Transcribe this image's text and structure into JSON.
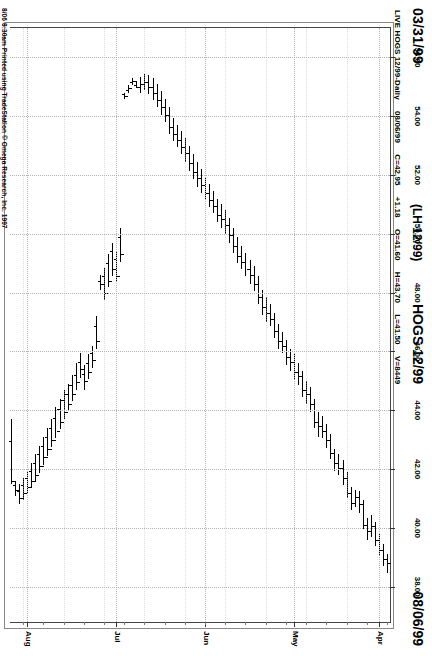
{
  "header": {
    "date_left": "03/31/99",
    "symbol_paren": "(LH 12/99)",
    "symbol_title": "HOGS 12/99",
    "date_right": "08/06/99"
  },
  "quote": {
    "instrument": "LIVE HOGS 12/99-Daily",
    "date": "08/06/99",
    "close": "C=42.95",
    "change": "+1.18",
    "open": "O=41.60",
    "high": "H=43.70",
    "low": "L=41.50",
    "volume": "V=8449"
  },
  "credit": "8/06 8:30am Printed using TradeStation © Omega Research, Inc. 1997",
  "colors": {
    "bar": "#000000",
    "grid": "#b4b4b4",
    "frame": "#444444",
    "background": "#ffffff"
  },
  "chart_data": {
    "type": "ohlc-bar",
    "title": "HOGS 12/99",
    "subtitle": "LIVE HOGS 12/99-Daily",
    "orientation": "rotated-90",
    "xlabel": "",
    "ylabel": "",
    "grid": true,
    "legend": "none",
    "ylim": [
      36.8,
      57.0
    ],
    "price_ticks": [
      "56.00",
      "54.00",
      "52.00",
      "50.00",
      "48.00",
      "46.00",
      "44.00",
      "42.00",
      "40.00",
      "38.00"
    ],
    "price_tick_values": [
      56.0,
      54.0,
      52.0,
      50.0,
      48.0,
      46.0,
      44.0,
      42.0,
      40.0,
      38.0
    ],
    "date_ticks": [
      "Apr",
      "May",
      "Jun",
      "Jul",
      "Aug"
    ],
    "date_tick_index": [
      2,
      23,
      45,
      67,
      89
    ],
    "xlim_dates": [
      "03/31/99",
      "08/06/99"
    ],
    "n_bars": 94,
    "bars": [
      {
        "i": 0,
        "o": 38.8,
        "h": 39.1,
        "l": 38.45,
        "c": 38.95
      },
      {
        "i": 1,
        "o": 38.95,
        "h": 39.45,
        "l": 38.7,
        "c": 39.25
      },
      {
        "i": 2,
        "o": 39.25,
        "h": 39.8,
        "l": 39.05,
        "c": 39.6
      },
      {
        "i": 3,
        "o": 39.6,
        "h": 40.2,
        "l": 39.4,
        "c": 40.05
      },
      {
        "i": 4,
        "o": 40.05,
        "h": 40.45,
        "l": 39.7,
        "c": 39.9
      },
      {
        "i": 5,
        "o": 39.9,
        "h": 40.35,
        "l": 39.6,
        "c": 40.1
      },
      {
        "i": 6,
        "o": 40.1,
        "h": 40.95,
        "l": 39.95,
        "c": 40.8
      },
      {
        "i": 7,
        "o": 40.8,
        "h": 41.25,
        "l": 40.5,
        "c": 41.05
      },
      {
        "i": 8,
        "o": 41.05,
        "h": 41.3,
        "l": 40.7,
        "c": 40.85
      },
      {
        "i": 9,
        "o": 40.85,
        "h": 41.4,
        "l": 40.6,
        "c": 41.2
      },
      {
        "i": 10,
        "o": 41.2,
        "h": 41.9,
        "l": 41.0,
        "c": 41.7
      },
      {
        "i": 11,
        "o": 41.7,
        "h": 42.3,
        "l": 41.45,
        "c": 42.05
      },
      {
        "i": 12,
        "o": 42.05,
        "h": 42.5,
        "l": 41.8,
        "c": 42.2
      },
      {
        "i": 13,
        "o": 42.2,
        "h": 42.7,
        "l": 41.95,
        "c": 42.55
      },
      {
        "i": 14,
        "o": 42.55,
        "h": 43.2,
        "l": 42.35,
        "c": 43.0
      },
      {
        "i": 15,
        "o": 43.0,
        "h": 43.55,
        "l": 42.7,
        "c": 43.3
      },
      {
        "i": 16,
        "o": 43.3,
        "h": 43.8,
        "l": 43.05,
        "c": 43.45
      },
      {
        "i": 17,
        "o": 43.45,
        "h": 43.95,
        "l": 43.1,
        "c": 43.6
      },
      {
        "i": 18,
        "o": 43.6,
        "h": 44.4,
        "l": 43.4,
        "c": 44.2
      },
      {
        "i": 19,
        "o": 44.2,
        "h": 44.8,
        "l": 43.95,
        "c": 44.55
      },
      {
        "i": 20,
        "o": 44.55,
        "h": 45.0,
        "l": 44.2,
        "c": 44.7
      },
      {
        "i": 21,
        "o": 44.7,
        "h": 45.35,
        "l": 44.45,
        "c": 45.15
      },
      {
        "i": 22,
        "o": 45.15,
        "h": 45.6,
        "l": 44.85,
        "c": 45.3
      },
      {
        "i": 23,
        "o": 45.3,
        "h": 45.9,
        "l": 45.05,
        "c": 45.65
      },
      {
        "i": 24,
        "o": 45.65,
        "h": 46.1,
        "l": 45.35,
        "c": 45.8
      },
      {
        "i": 25,
        "o": 45.8,
        "h": 46.4,
        "l": 45.55,
        "c": 46.2
      },
      {
        "i": 26,
        "o": 46.2,
        "h": 46.65,
        "l": 45.95,
        "c": 46.35
      },
      {
        "i": 27,
        "o": 46.35,
        "h": 46.95,
        "l": 46.1,
        "c": 46.7
      },
      {
        "i": 28,
        "o": 46.7,
        "h": 47.3,
        "l": 46.45,
        "c": 47.1
      },
      {
        "i": 29,
        "o": 47.1,
        "h": 47.6,
        "l": 46.85,
        "c": 47.3
      },
      {
        "i": 30,
        "o": 47.3,
        "h": 47.85,
        "l": 47.0,
        "c": 47.5
      },
      {
        "i": 31,
        "o": 47.5,
        "h": 48.1,
        "l": 47.25,
        "c": 47.85
      },
      {
        "i": 32,
        "o": 47.85,
        "h": 48.55,
        "l": 47.6,
        "c": 48.3
      },
      {
        "i": 33,
        "o": 48.3,
        "h": 48.9,
        "l": 48.05,
        "c": 48.6
      },
      {
        "i": 34,
        "o": 48.6,
        "h": 49.1,
        "l": 48.3,
        "c": 48.8
      },
      {
        "i": 35,
        "o": 48.8,
        "h": 49.35,
        "l": 48.55,
        "c": 49.05
      },
      {
        "i": 36,
        "o": 49.05,
        "h": 49.6,
        "l": 48.8,
        "c": 49.25
      },
      {
        "i": 37,
        "o": 49.25,
        "h": 49.9,
        "l": 49.0,
        "c": 49.6
      },
      {
        "i": 38,
        "o": 49.6,
        "h": 50.2,
        "l": 49.35,
        "c": 49.95
      },
      {
        "i": 39,
        "o": 49.95,
        "h": 50.55,
        "l": 49.7,
        "c": 50.3
      },
      {
        "i": 40,
        "o": 50.3,
        "h": 50.8,
        "l": 50.0,
        "c": 50.5
      },
      {
        "i": 41,
        "o": 50.5,
        "h": 51.0,
        "l": 50.2,
        "c": 50.65
      },
      {
        "i": 42,
        "o": 50.65,
        "h": 51.2,
        "l": 50.4,
        "c": 50.95
      },
      {
        "i": 43,
        "o": 50.95,
        "h": 51.45,
        "l": 50.7,
        "c": 51.15
      },
      {
        "i": 44,
        "o": 51.15,
        "h": 51.7,
        "l": 50.9,
        "c": 51.4
      },
      {
        "i": 45,
        "o": 51.4,
        "h": 51.95,
        "l": 51.15,
        "c": 51.65
      },
      {
        "i": 46,
        "o": 51.65,
        "h": 52.2,
        "l": 51.4,
        "c": 51.9
      },
      {
        "i": 47,
        "o": 51.9,
        "h": 52.45,
        "l": 51.6,
        "c": 52.1
      },
      {
        "i": 48,
        "o": 52.1,
        "h": 52.7,
        "l": 51.85,
        "c": 52.4
      },
      {
        "i": 49,
        "o": 52.4,
        "h": 53.0,
        "l": 52.15,
        "c": 52.75
      },
      {
        "i": 50,
        "o": 52.75,
        "h": 53.25,
        "l": 52.45,
        "c": 52.95
      },
      {
        "i": 51,
        "o": 52.95,
        "h": 53.5,
        "l": 52.7,
        "c": 53.2
      },
      {
        "i": 52,
        "o": 53.2,
        "h": 53.7,
        "l": 52.95,
        "c": 53.4
      },
      {
        "i": 53,
        "o": 53.4,
        "h": 53.95,
        "l": 53.15,
        "c": 53.65
      },
      {
        "i": 54,
        "o": 53.65,
        "h": 54.3,
        "l": 53.4,
        "c": 54.05
      },
      {
        "i": 55,
        "o": 54.05,
        "h": 54.6,
        "l": 53.8,
        "c": 54.3
      },
      {
        "i": 56,
        "o": 54.3,
        "h": 54.85,
        "l": 54.05,
        "c": 54.55
      },
      {
        "i": 57,
        "o": 54.55,
        "h": 55.1,
        "l": 54.3,
        "c": 54.8
      },
      {
        "i": 58,
        "o": 54.8,
        "h": 55.3,
        "l": 54.55,
        "c": 55.0
      },
      {
        "i": 59,
        "o": 55.0,
        "h": 55.4,
        "l": 54.75,
        "c": 55.15
      },
      {
        "i": 60,
        "o": 55.15,
        "h": 55.45,
        "l": 54.9,
        "c": 55.1
      },
      {
        "i": 61,
        "o": 55.1,
        "h": 55.35,
        "l": 54.8,
        "c": 55.0
      },
      {
        "i": 62,
        "o": 55.0,
        "h": 55.2,
        "l": 54.95,
        "c": 55.05
      },
      {
        "i": 63,
        "o": 55.2,
        "h": 55.3,
        "l": 55.05,
        "c": 55.15
      },
      {
        "i": 64,
        "o": 54.95,
        "h": 55.05,
        "l": 54.8,
        "c": 54.9
      },
      {
        "i": 65,
        "o": 54.7,
        "h": 54.8,
        "l": 54.6,
        "c": 54.75
      },
      {
        "i": 66,
        "o": 49.3,
        "h": 50.2,
        "l": 49.05,
        "c": 49.9
      },
      {
        "i": 67,
        "o": 48.55,
        "h": 49.4,
        "l": 48.35,
        "c": 49.15
      },
      {
        "i": 68,
        "o": 48.8,
        "h": 49.7,
        "l": 48.55,
        "c": 49.4
      },
      {
        "i": 69,
        "o": 48.4,
        "h": 49.3,
        "l": 48.2,
        "c": 49.0
      },
      {
        "i": 70,
        "o": 48.0,
        "h": 48.85,
        "l": 47.75,
        "c": 48.55
      },
      {
        "i": 71,
        "o": 48.3,
        "h": 48.6,
        "l": 48.1,
        "c": 48.4
      },
      {
        "i": 72,
        "o": 46.35,
        "h": 47.2,
        "l": 46.1,
        "c": 46.85
      },
      {
        "i": 73,
        "o": 45.7,
        "h": 46.2,
        "l": 45.45,
        "c": 45.95
      },
      {
        "i": 74,
        "o": 45.3,
        "h": 45.9,
        "l": 45.05,
        "c": 45.6
      },
      {
        "i": 75,
        "o": 45.0,
        "h": 45.55,
        "l": 44.7,
        "c": 45.25
      },
      {
        "i": 76,
        "o": 45.4,
        "h": 45.95,
        "l": 45.1,
        "c": 45.65
      },
      {
        "i": 77,
        "o": 44.95,
        "h": 45.6,
        "l": 44.7,
        "c": 45.2
      },
      {
        "i": 78,
        "o": 44.55,
        "h": 45.2,
        "l": 44.3,
        "c": 44.85
      },
      {
        "i": 79,
        "o": 44.2,
        "h": 44.9,
        "l": 44.0,
        "c": 44.55
      },
      {
        "i": 80,
        "o": 43.95,
        "h": 44.7,
        "l": 43.7,
        "c": 44.35
      },
      {
        "i": 81,
        "o": 43.6,
        "h": 44.4,
        "l": 43.35,
        "c": 44.05
      },
      {
        "i": 82,
        "o": 43.3,
        "h": 44.1,
        "l": 43.05,
        "c": 43.75
      },
      {
        "i": 83,
        "o": 43.0,
        "h": 43.7,
        "l": 42.75,
        "c": 43.4
      },
      {
        "i": 84,
        "o": 42.7,
        "h": 43.4,
        "l": 42.45,
        "c": 43.1
      },
      {
        "i": 85,
        "o": 42.4,
        "h": 43.1,
        "l": 42.15,
        "c": 42.8
      },
      {
        "i": 86,
        "o": 42.1,
        "h": 42.8,
        "l": 41.85,
        "c": 42.5
      },
      {
        "i": 87,
        "o": 41.8,
        "h": 42.5,
        "l": 41.55,
        "c": 42.2
      },
      {
        "i": 88,
        "o": 41.6,
        "h": 42.2,
        "l": 41.35,
        "c": 41.95
      },
      {
        "i": 89,
        "o": 41.4,
        "h": 41.95,
        "l": 41.15,
        "c": 41.7
      },
      {
        "i": 90,
        "o": 41.2,
        "h": 41.7,
        "l": 40.95,
        "c": 41.45
      },
      {
        "i": 91,
        "o": 41.0,
        "h": 41.5,
        "l": 40.8,
        "c": 41.25
      },
      {
        "i": 92,
        "o": 41.3,
        "h": 41.6,
        "l": 41.1,
        "c": 41.45
      },
      {
        "i": 93,
        "o": 41.6,
        "h": 43.7,
        "l": 41.5,
        "c": 42.95
      }
    ]
  }
}
